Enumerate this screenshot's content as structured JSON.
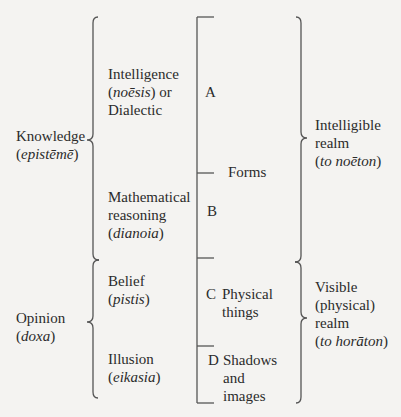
{
  "diagram": {
    "left_groups": [
      {
        "label": "Knowledge",
        "greek": "epistēmē"
      },
      {
        "label": "Opinion",
        "greek": "doxa"
      }
    ],
    "faculties": [
      {
        "line1": "Intelligence",
        "greek": "noēsis",
        "suffix": " or",
        "line3": "Dialectic"
      },
      {
        "line1": "Mathematical",
        "line2": "reasoning",
        "greek": "dianoia"
      },
      {
        "line1": "Belief",
        "greek": "pistis"
      },
      {
        "line1": "Illusion",
        "greek": "eikasia"
      }
    ],
    "segments": [
      {
        "letter": "A",
        "object": ""
      },
      {
        "letter": "B",
        "object": ""
      },
      {
        "letter": "C",
        "object_line1": "Physical",
        "object_line2": "things"
      },
      {
        "letter": "D",
        "object_line1": "Shadows",
        "object_line2": "and",
        "object_line3": "images"
      }
    ],
    "forms_label": "Forms",
    "right_groups": [
      {
        "line1": "Intelligible",
        "line2": "realm",
        "prefix": "to ",
        "greek": "noēton"
      },
      {
        "line1": "Visible",
        "line2": "(physical)",
        "line3": "realm",
        "prefix": "to ",
        "greek": "horāton"
      }
    ]
  }
}
